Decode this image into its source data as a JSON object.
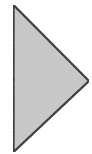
{
  "shape": {
    "type": "triangle",
    "direction": "right",
    "icon": "play-triangle-icon",
    "fill_color": "#c9c9c9",
    "stroke_color": "#1e1e1e",
    "background_color": "#ffffff",
    "points": "13.5,5 89,81 13.5,152"
  }
}
